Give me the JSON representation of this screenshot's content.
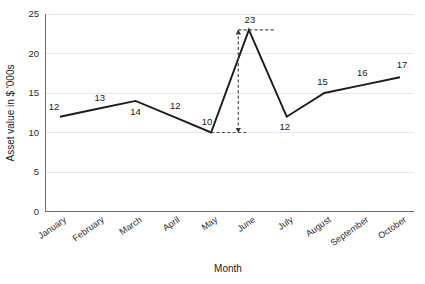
{
  "chart_data": {
    "type": "line",
    "title": "",
    "xlabel": "Month",
    "ylabel": "Asset value in $ '000s",
    "categories": [
      "January",
      "February",
      "March",
      "April",
      "May",
      "June",
      "July",
      "August",
      "September",
      "October"
    ],
    "values": [
      12,
      13,
      14,
      12,
      10,
      23,
      12,
      15,
      16,
      17
    ],
    "point_labels": [
      "12",
      "13",
      "14",
      "12",
      "10",
      "23",
      "12",
      "15",
      "16",
      "17"
    ],
    "point_label_positions": [
      "above",
      "above",
      "below",
      "above",
      "above",
      "above",
      "below",
      "above",
      "above",
      "above"
    ],
    "ylim": [
      0,
      25
    ],
    "yticks": [
      0,
      5,
      10,
      15,
      20,
      25
    ],
    "ytick_labels": [
      "0",
      "5",
      "10",
      "15",
      "20",
      "25"
    ],
    "grid": true,
    "grid_axis": "y",
    "legend": "none",
    "series": [
      {
        "name": "Asset value",
        "values": [
          12,
          13,
          14,
          12,
          10,
          23,
          12,
          15,
          16,
          17
        ],
        "color": "#1c1c1c"
      }
    ],
    "annotations": [
      {
        "kind": "double-arrow-range",
        "label": "23",
        "from_value": 10,
        "to_value": 23,
        "from_category": "May",
        "to_category": "June",
        "style": "dashed",
        "color": "#4a4a4a"
      }
    ]
  },
  "colors": {
    "series": "#1c1c1c",
    "axis": "#6b6b6b",
    "grid": "#e3e3e6",
    "annotation": "#4a4a4a",
    "text": "#1a1a1a",
    "background": "#ffffff"
  }
}
